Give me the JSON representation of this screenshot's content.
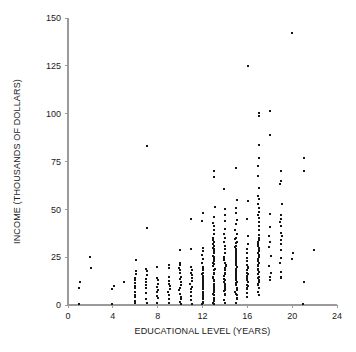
{
  "chart_data": {
    "type": "scatter",
    "title": "",
    "xlabel": "EDUCATIONAL LEVEL (YEARS)",
    "ylabel": "INCOME (THOUSANDS OF DOLLARS)",
    "xlim": [
      0,
      24
    ],
    "ylim": [
      0,
      150
    ],
    "xticks": [
      0,
      4,
      8,
      12,
      16,
      20,
      24
    ],
    "yticks": [
      0,
      25,
      50,
      75,
      100,
      125,
      150
    ],
    "xtick_labels": [
      "0",
      "4",
      "8",
      "12",
      "16",
      "20",
      "24"
    ],
    "ytick_labels": [
      "0",
      "25",
      "50",
      "75",
      "100",
      "125",
      "150"
    ],
    "grid": false,
    "legend": null,
    "marker": "square",
    "marker_color": "#16161a",
    "marker_size_px": 2,
    "axis_color": "#9a9a9a",
    "background_color": "#ffffff",
    "points": [
      [
        1,
        12
      ],
      [
        1,
        9
      ],
      [
        1,
        0.5
      ],
      [
        2,
        25
      ],
      [
        2,
        19.5
      ],
      [
        4,
        10
      ],
      [
        4,
        8
      ],
      [
        4,
        0.5
      ],
      [
        5,
        12
      ],
      [
        6,
        24
      ],
      [
        6,
        17.5
      ],
      [
        6,
        16
      ],
      [
        6,
        14.5
      ],
      [
        6,
        13
      ],
      [
        6,
        11.5
      ],
      [
        6,
        10
      ],
      [
        6,
        8.5
      ],
      [
        6,
        7
      ],
      [
        6,
        5.5
      ],
      [
        6,
        4
      ],
      [
        6,
        2.5
      ],
      [
        6,
        1
      ],
      [
        7,
        40
      ],
      [
        7,
        83
      ],
      [
        7,
        19
      ],
      [
        7,
        17.5
      ],
      [
        7,
        15.5
      ],
      [
        7,
        13.5
      ],
      [
        7,
        12
      ],
      [
        7,
        10.5
      ],
      [
        7,
        9
      ],
      [
        7,
        6
      ],
      [
        7,
        3
      ],
      [
        7,
        1
      ],
      [
        8,
        20
      ],
      [
        8,
        14
      ],
      [
        8,
        12.5
      ],
      [
        8,
        11
      ],
      [
        8,
        9.5
      ],
      [
        8,
        8
      ],
      [
        8,
        6.5
      ],
      [
        8,
        5
      ],
      [
        8,
        3.5
      ],
      [
        8,
        1
      ],
      [
        9,
        21
      ],
      [
        9,
        19
      ],
      [
        9,
        14.5
      ],
      [
        9,
        13
      ],
      [
        9,
        11.5
      ],
      [
        9,
        10
      ],
      [
        9,
        8.5
      ],
      [
        9,
        7
      ],
      [
        9,
        5.5
      ],
      [
        9,
        3
      ],
      [
        9,
        1
      ],
      [
        10,
        29
      ],
      [
        10,
        22
      ],
      [
        10,
        21
      ],
      [
        10,
        19.5
      ],
      [
        10,
        18
      ],
      [
        10,
        16.5
      ],
      [
        10,
        15
      ],
      [
        10,
        13.5
      ],
      [
        10,
        12
      ],
      [
        10,
        10.5
      ],
      [
        10,
        9
      ],
      [
        10,
        7.5
      ],
      [
        10,
        6
      ],
      [
        10,
        4.5
      ],
      [
        10,
        3
      ],
      [
        10,
        1.5
      ],
      [
        10,
        0.5
      ],
      [
        11,
        29
      ],
      [
        11,
        45
      ],
      [
        11,
        20
      ],
      [
        11,
        18.5
      ],
      [
        11,
        17
      ],
      [
        11,
        15.5
      ],
      [
        11,
        14
      ],
      [
        11,
        12.5
      ],
      [
        11,
        11
      ],
      [
        11,
        9.5
      ],
      [
        11,
        8
      ],
      [
        11,
        6.5
      ],
      [
        11,
        5
      ],
      [
        11,
        3
      ],
      [
        11,
        1
      ],
      [
        12,
        48
      ],
      [
        12,
        44
      ],
      [
        12,
        30
      ],
      [
        12,
        28
      ],
      [
        12,
        26
      ],
      [
        12,
        24
      ],
      [
        12,
        22
      ],
      [
        12,
        20
      ],
      [
        12,
        19
      ],
      [
        12,
        18
      ],
      [
        12,
        17
      ],
      [
        12,
        16
      ],
      [
        12,
        15
      ],
      [
        12,
        14
      ],
      [
        12,
        13
      ],
      [
        12,
        12
      ],
      [
        12,
        11
      ],
      [
        12,
        10
      ],
      [
        12,
        9
      ],
      [
        12,
        8
      ],
      [
        12,
        7
      ],
      [
        12,
        6
      ],
      [
        12,
        5
      ],
      [
        12,
        4
      ],
      [
        12,
        3
      ],
      [
        12,
        2
      ],
      [
        12,
        1
      ],
      [
        12,
        0.5
      ],
      [
        13,
        70
      ],
      [
        13,
        67
      ],
      [
        13,
        51
      ],
      [
        13,
        46
      ],
      [
        13,
        43
      ],
      [
        13,
        41
      ],
      [
        13,
        39
      ],
      [
        13,
        37
      ],
      [
        13,
        35
      ],
      [
        13,
        34
      ],
      [
        13,
        33
      ],
      [
        13,
        32
      ],
      [
        13,
        31
      ],
      [
        13,
        30
      ],
      [
        13,
        29
      ],
      [
        13,
        28
      ],
      [
        13,
        27
      ],
      [
        13,
        26
      ],
      [
        13,
        25
      ],
      [
        13,
        24
      ],
      [
        13,
        23
      ],
      [
        13,
        22
      ],
      [
        13,
        21
      ],
      [
        13,
        20
      ],
      [
        13,
        19
      ],
      [
        13,
        18
      ],
      [
        13,
        17
      ],
      [
        13,
        16
      ],
      [
        13,
        15
      ],
      [
        13,
        14
      ],
      [
        13,
        13
      ],
      [
        13,
        12
      ],
      [
        13,
        11
      ],
      [
        13,
        10
      ],
      [
        13,
        9
      ],
      [
        13,
        8
      ],
      [
        13,
        7
      ],
      [
        13,
        6
      ],
      [
        13,
        5
      ],
      [
        13,
        4
      ],
      [
        13,
        3
      ],
      [
        13,
        2
      ],
      [
        13,
        1
      ],
      [
        13,
        0.5
      ],
      [
        14,
        61
      ],
      [
        14,
        50
      ],
      [
        14,
        47
      ],
      [
        14,
        44
      ],
      [
        14,
        40
      ],
      [
        14,
        37
      ],
      [
        14,
        35
      ],
      [
        14,
        33
      ],
      [
        14,
        31
      ],
      [
        14,
        29
      ],
      [
        14,
        27
      ],
      [
        14,
        25
      ],
      [
        14,
        24
      ],
      [
        14,
        23
      ],
      [
        14,
        22
      ],
      [
        14,
        21
      ],
      [
        14,
        20
      ],
      [
        14,
        19
      ],
      [
        14,
        18
      ],
      [
        14,
        17
      ],
      [
        14,
        16
      ],
      [
        14,
        15
      ],
      [
        14,
        14
      ],
      [
        14,
        13
      ],
      [
        14,
        12
      ],
      [
        14,
        11
      ],
      [
        14,
        10
      ],
      [
        14,
        9
      ],
      [
        14,
        8
      ],
      [
        14,
        7
      ],
      [
        14,
        6
      ],
      [
        14,
        5
      ],
      [
        14,
        3
      ],
      [
        14,
        1
      ],
      [
        15,
        72
      ],
      [
        15,
        55
      ],
      [
        15,
        51
      ],
      [
        15,
        48
      ],
      [
        15,
        45
      ],
      [
        15,
        42
      ],
      [
        15,
        39
      ],
      [
        15,
        37
      ],
      [
        15,
        35
      ],
      [
        15,
        34
      ],
      [
        15,
        33
      ],
      [
        15,
        32
      ],
      [
        15,
        31
      ],
      [
        15,
        30
      ],
      [
        15,
        29
      ],
      [
        15,
        28
      ],
      [
        15,
        27
      ],
      [
        15,
        26
      ],
      [
        15,
        25
      ],
      [
        15,
        24
      ],
      [
        15,
        23
      ],
      [
        15,
        22
      ],
      [
        15,
        21
      ],
      [
        15,
        20
      ],
      [
        15,
        19
      ],
      [
        15,
        18
      ],
      [
        15,
        17
      ],
      [
        15,
        16
      ],
      [
        15,
        15
      ],
      [
        15,
        14
      ],
      [
        15,
        13
      ],
      [
        15,
        12
      ],
      [
        15,
        11
      ],
      [
        15,
        10
      ],
      [
        15,
        9
      ],
      [
        15,
        8
      ],
      [
        15,
        7
      ],
      [
        15,
        6
      ],
      [
        15,
        5
      ],
      [
        15,
        4
      ],
      [
        15,
        3
      ],
      [
        15,
        1
      ],
      [
        16,
        125
      ],
      [
        16,
        54
      ],
      [
        16,
        45
      ],
      [
        16,
        36
      ],
      [
        16,
        32
      ],
      [
        16,
        29
      ],
      [
        16,
        27
      ],
      [
        16,
        25
      ],
      [
        16,
        23
      ],
      [
        16,
        21
      ],
      [
        16,
        20
      ],
      [
        16,
        19
      ],
      [
        16,
        18
      ],
      [
        16,
        17
      ],
      [
        16,
        16
      ],
      [
        16,
        15
      ],
      [
        16,
        14
      ],
      [
        16,
        13
      ],
      [
        16,
        12
      ],
      [
        16,
        11
      ],
      [
        16,
        10
      ],
      [
        16,
        9
      ],
      [
        16,
        8
      ],
      [
        16,
        6
      ],
      [
        16,
        4
      ],
      [
        17,
        100
      ],
      [
        17,
        99
      ],
      [
        17,
        84
      ],
      [
        17,
        77
      ],
      [
        17,
        73
      ],
      [
        17,
        67
      ],
      [
        17,
        61
      ],
      [
        17,
        57
      ],
      [
        17,
        55
      ],
      [
        17,
        53
      ],
      [
        17,
        51
      ],
      [
        17,
        49
      ],
      [
        17,
        47
      ],
      [
        17,
        45
      ],
      [
        17,
        43
      ],
      [
        17,
        41
      ],
      [
        17,
        39
      ],
      [
        17,
        37
      ],
      [
        17,
        35
      ],
      [
        17,
        34
      ],
      [
        17,
        33
      ],
      [
        17,
        32
      ],
      [
        17,
        31
      ],
      [
        17,
        30
      ],
      [
        17,
        29
      ],
      [
        17,
        28
      ],
      [
        17,
        27
      ],
      [
        17,
        26
      ],
      [
        17,
        25
      ],
      [
        17,
        24
      ],
      [
        17,
        23
      ],
      [
        17,
        22
      ],
      [
        17,
        21
      ],
      [
        17,
        20
      ],
      [
        17,
        19
      ],
      [
        17,
        18
      ],
      [
        17,
        17
      ],
      [
        17,
        16
      ],
      [
        17,
        15
      ],
      [
        17,
        14
      ],
      [
        17,
        13
      ],
      [
        17,
        12
      ],
      [
        17,
        11
      ],
      [
        17,
        10
      ],
      [
        17,
        9
      ],
      [
        17,
        7
      ],
      [
        17,
        5
      ],
      [
        18,
        101
      ],
      [
        18,
        89
      ],
      [
        18,
        47
      ],
      [
        18,
        41
      ],
      [
        18,
        36
      ],
      [
        18,
        33
      ],
      [
        18,
        30
      ],
      [
        18,
        26
      ],
      [
        18,
        20
      ],
      [
        18,
        17
      ],
      [
        18,
        15
      ],
      [
        18,
        13
      ],
      [
        19,
        70
      ],
      [
        19,
        65
      ],
      [
        19,
        63
      ],
      [
        19,
        53
      ],
      [
        19,
        47
      ],
      [
        19,
        45
      ],
      [
        19,
        43
      ],
      [
        19,
        41
      ],
      [
        19,
        38
      ],
      [
        19,
        36
      ],
      [
        19,
        34
      ],
      [
        19,
        32
      ],
      [
        19,
        29
      ],
      [
        19,
        25
      ],
      [
        19,
        22
      ],
      [
        19,
        17
      ],
      [
        19,
        15
      ],
      [
        19,
        14
      ],
      [
        20,
        142
      ],
      [
        20,
        27
      ],
      [
        20,
        24
      ],
      [
        21,
        77
      ],
      [
        21,
        70
      ],
      [
        21,
        12
      ],
      [
        21,
        0.5
      ],
      [
        22,
        29
      ]
    ]
  },
  "axes": {
    "x_title": "EDUCATIONAL LEVEL (YEARS)",
    "y_title": "INCOME (THOUSANDS OF DOLLARS)"
  }
}
